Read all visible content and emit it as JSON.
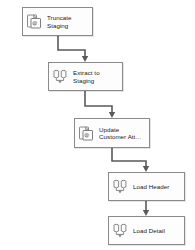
{
  "diagram": {
    "background_color": "#ffffff",
    "box_border_color": "#8a8a8a",
    "connector_color": "#5a5a5a",
    "nodes": [
      {
        "id": "truncate-staging",
        "label": "Truncate\nStaging",
        "icon": "execute-sql-task-icon",
        "x": 22,
        "y": 7,
        "width": 71,
        "height": 29
      },
      {
        "id": "extract-to-staging",
        "label": "Extract to\nStaging",
        "icon": "data-flow-task-icon",
        "x": 48,
        "y": 62,
        "width": 75,
        "height": 29
      },
      {
        "id": "update-customer-attributes",
        "label": "Update\nCustomer Att…",
        "icon": "execute-sql-task-icon",
        "x": 74,
        "y": 118,
        "width": 76,
        "height": 30
      },
      {
        "id": "load-header",
        "label": "Load Header",
        "icon": "data-flow-task-icon",
        "x": 108,
        "y": 172,
        "width": 77,
        "height": 29
      },
      {
        "id": "load-detail",
        "label": "Load Detail",
        "icon": "data-flow-task-icon",
        "x": 108,
        "y": 216,
        "width": 77,
        "height": 29
      }
    ],
    "connectors": [
      {
        "id": "truncate-to-extract",
        "from": "truncate-staging",
        "to": "extract-to-staging",
        "path": "M 58 36 L 58 50 L 85 50 L 85 60",
        "arrow": "M 85 62 L 81.8 56 L 88.2 56 Z"
      },
      {
        "id": "extract-to-update",
        "from": "extract-to-staging",
        "to": "update-customer-attributes",
        "path": "M 85 91 L 85 106 L 112 106 L 112 116",
        "arrow": "M 112 118 L 108.8 112 L 115.2 112 Z"
      },
      {
        "id": "update-to-load-header",
        "from": "update-customer-attributes",
        "to": "load-header",
        "path": "M 112 148 L 112 161 L 146 161 L 146 170",
        "arrow": "M 146 172 L 142.8 166 L 149.2 166 Z"
      },
      {
        "id": "load-header-to-load-detail",
        "from": "load-header",
        "to": "load-detail",
        "path": "M 146 201 L 146 214",
        "arrow": "M 146 216 L 142.8 210 L 149.2 210 Z"
      }
    ]
  }
}
